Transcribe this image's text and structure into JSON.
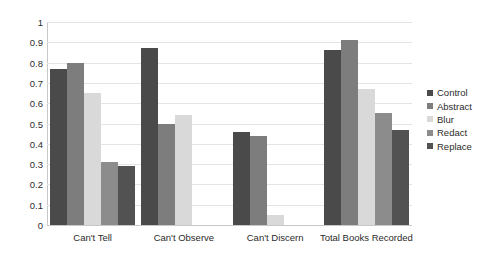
{
  "chart_data": {
    "type": "bar",
    "title": "",
    "subtitle": "",
    "xlabel": "",
    "ylabel": "",
    "ylim": [
      0,
      1
    ],
    "yticks": [
      "0",
      "0.1",
      "0.2",
      "0.3",
      "0.4",
      "0.5",
      "0.6",
      "0.7",
      "0.8",
      "0.9",
      "1"
    ],
    "ytick_values": [
      0,
      0.1,
      0.2,
      0.3,
      0.4,
      0.5,
      0.6,
      0.7,
      0.8,
      0.9,
      1
    ],
    "grid": true,
    "legend_position": "right",
    "categories": [
      "Can't Tell",
      "Can't Observe",
      "Can't Discern",
      "Total Books Recorded"
    ],
    "series": [
      {
        "name": "Control",
        "color": "#4a4a4a",
        "values": [
          0.77,
          0.87,
          0.46,
          0.86
        ]
      },
      {
        "name": "Abstract",
        "color": "#7d7d7d",
        "values": [
          0.8,
          0.5,
          0.44,
          0.91
        ]
      },
      {
        "name": "Blur",
        "color": "#d9d9d9",
        "values": [
          0.65,
          0.54,
          0.05,
          0.67
        ]
      },
      {
        "name": "Redact",
        "color": "#8c8c8c",
        "values": [
          0.31,
          0.0,
          0.0,
          0.55
        ]
      },
      {
        "name": "Replace",
        "color": "#525252",
        "values": [
          0.29,
          0.0,
          0.0,
          0.47
        ]
      }
    ]
  },
  "colors": {
    "background": "#ffffff",
    "gridline": "#e4e4e4",
    "axis": "#c8c8c8",
    "text": "#2b2b2b"
  }
}
